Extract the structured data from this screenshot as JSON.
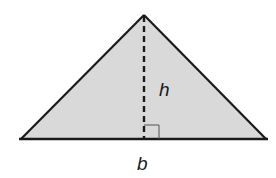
{
  "diagram": {
    "shape": "triangle",
    "fill_color": "#d9d9d9",
    "stroke_color": "#1a1a1a",
    "vertices": {
      "apex": [
        144,
        15
      ],
      "left": [
        21,
        139
      ],
      "right": [
        266,
        139
      ]
    },
    "labels": {
      "height": "h",
      "base": "b"
    },
    "altitude_style": "dashed",
    "right_angle_marker": true
  }
}
